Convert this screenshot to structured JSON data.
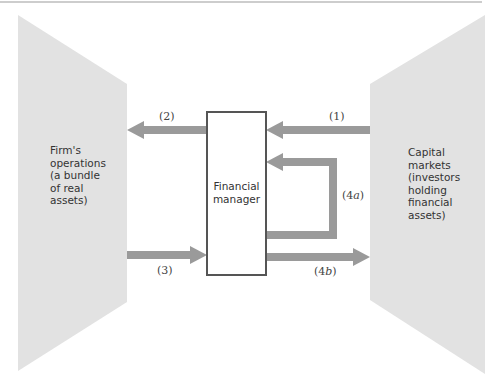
{
  "diagram": {
    "colors": {
      "panel_fill": "#e2e2e2",
      "arrow_fill": "#9a9a9a",
      "box_border": "#555555",
      "box_fill": "#ffffff",
      "rule_line": "#999999"
    },
    "left_panel": {
      "label": "Firm's\noperations\n(a bundle\nof real\nassets)"
    },
    "right_panel": {
      "label": "Capital\nmarkets\n(investors\nholding\nfinancial\nassets)"
    },
    "center_box": {
      "label": "Financial\nmanager"
    },
    "arrows": [
      {
        "id": "1",
        "prefix": "(",
        "number": "1",
        "suffix": "",
        "close": ")",
        "direction": "right-to-left",
        "from": "Capital markets",
        "to": "Financial manager"
      },
      {
        "id": "2",
        "prefix": "(",
        "number": "2",
        "suffix": "",
        "close": ")",
        "direction": "right-to-left",
        "from": "Financial manager",
        "to": "Firm's operations"
      },
      {
        "id": "3",
        "prefix": "(",
        "number": "3",
        "suffix": "",
        "close": ")",
        "direction": "left-to-right",
        "from": "Firm's operations",
        "to": "Financial manager"
      },
      {
        "id": "4a",
        "prefix": "(",
        "number": "4",
        "suffix": "a",
        "close": ")",
        "direction": "loop-back",
        "from": "Financial manager",
        "to": "Financial manager"
      },
      {
        "id": "4b",
        "prefix": "(",
        "number": "4",
        "suffix": "b",
        "close": ")",
        "direction": "left-to-right",
        "from": "Financial manager",
        "to": "Capital markets"
      }
    ]
  }
}
